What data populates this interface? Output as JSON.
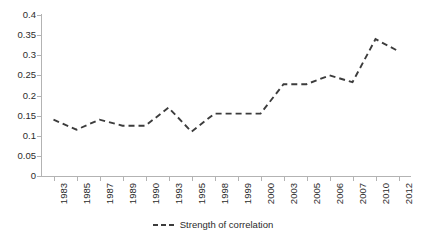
{
  "chart_data": {
    "type": "line",
    "title": "",
    "subtitle": "",
    "xlabel": "",
    "ylabel": "",
    "grid": false,
    "legend_position": "bottom-center",
    "ylim": [
      0,
      0.4
    ],
    "ytick_labels": [
      "0.4",
      "0.35",
      "0.3",
      "0.25",
      "0.2",
      "0.15",
      "0.1",
      "0.05",
      "0"
    ],
    "ytick_values": [
      0.4,
      0.35,
      0.3,
      0.25,
      0.2,
      0.15,
      0.1,
      0.05,
      0
    ],
    "categories": [
      "1983",
      "1985",
      "1987",
      "1989",
      "1990",
      "1993",
      "1995",
      "1998",
      "1999",
      "2000",
      "2003",
      "2005",
      "2006",
      "2007",
      "2010",
      "2012"
    ],
    "series": [
      {
        "name": "Strength of correlation",
        "line_style": "dashed",
        "color": "#3c3c3c",
        "marker": "none",
        "values": [
          0.14,
          0.115,
          0.14,
          0.125,
          0.125,
          0.17,
          0.11,
          0.155,
          0.155,
          0.155,
          0.228,
          0.228,
          0.25,
          0.233,
          0.34,
          0.31
        ]
      }
    ],
    "legend": [
      {
        "label": "Strength of correlation",
        "color": "#3c3c3c",
        "style": "dashed"
      }
    ],
    "annotations": []
  },
  "colors": {
    "series_line": "#3c3c3c",
    "axis": "#b3b3b3",
    "tick_text": "#2b2b2b",
    "background": "#ffffff"
  }
}
